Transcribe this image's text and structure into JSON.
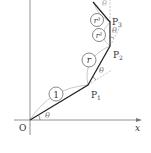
{
  "diagram": {
    "origin_label": "O",
    "x_axis_label": "x",
    "points": [
      {
        "label": "P",
        "sub": "1"
      },
      {
        "label": "P",
        "sub": "2"
      },
      {
        "label": "P",
        "sub": "3"
      }
    ],
    "segment_labels": [
      "1",
      "r",
      "r²",
      "r³"
    ],
    "angle_label": "θ"
  }
}
